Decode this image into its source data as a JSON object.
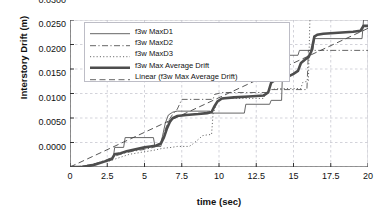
{
  "chart_data": {
    "type": "line",
    "title": "",
    "xlabel": "time (sec)",
    "ylabel": "Interstory Drift (m)",
    "xlim": [
      0,
      20
    ],
    "ylim": [
      0,
      0.03
    ],
    "xticks": [
      "0",
      "2.5",
      "5",
      "7.5",
      "10",
      "12.5",
      "15",
      "17.5",
      "20"
    ],
    "xtick_values": [
      0,
      2.5,
      5,
      7.5,
      10,
      12.5,
      15,
      17.5,
      20
    ],
    "yticks": [
      "0.0000",
      "0.0050",
      "0.0100",
      "0.0150",
      "0.0200",
      "0.0250",
      "0.0300"
    ],
    "ytick_values": [
      0,
      0.005,
      0.01,
      0.015,
      0.02,
      0.025,
      0.03
    ],
    "grid": true,
    "legend_position": "upper-left",
    "series": [
      {
        "name": "f3w  MaxD1",
        "style": "solid",
        "width": 0.9,
        "color": "#555555",
        "points": [
          [
            0,
            0.0
          ],
          [
            0.8,
            0.0
          ],
          [
            1.2,
            0.0004
          ],
          [
            1.6,
            0.0006
          ],
          [
            2.0,
            0.0008
          ],
          [
            2.4,
            0.0012
          ],
          [
            2.6,
            0.0016
          ],
          [
            2.9,
            0.0018
          ],
          [
            3.0,
            0.004
          ],
          [
            3.6,
            0.004
          ],
          [
            3.7,
            0.006
          ],
          [
            5.6,
            0.006
          ],
          [
            5.7,
            0.0042
          ],
          [
            6.1,
            0.0042
          ],
          [
            6.2,
            0.0062
          ],
          [
            6.4,
            0.009
          ],
          [
            6.6,
            0.0106
          ],
          [
            6.9,
            0.0112
          ],
          [
            7.2,
            0.0114
          ],
          [
            9.4,
            0.0114
          ],
          [
            9.5,
            0.011
          ],
          [
            11.7,
            0.011
          ],
          [
            11.8,
            0.0128
          ],
          [
            13.4,
            0.0128
          ],
          [
            13.5,
            0.0136
          ],
          [
            14.2,
            0.0136
          ],
          [
            14.3,
            0.0228
          ],
          [
            15.3,
            0.0228
          ],
          [
            15.4,
            0.0238
          ],
          [
            16.3,
            0.0238
          ],
          [
            16.4,
            0.0262
          ],
          [
            19.6,
            0.0262
          ],
          [
            19.7,
            0.03
          ],
          [
            20,
            0.03
          ]
        ]
      },
      {
        "name": "f3w  MaxD2",
        "style": "dashdot",
        "width": 0.9,
        "color": "#555555",
        "points": [
          [
            0,
            0.0
          ],
          [
            1.0,
            0.0002
          ],
          [
            1.8,
            0.0008
          ],
          [
            2.4,
            0.0014
          ],
          [
            3.0,
            0.0022
          ],
          [
            3.6,
            0.0028
          ],
          [
            4.2,
            0.0032
          ],
          [
            5.0,
            0.0036
          ],
          [
            5.6,
            0.004
          ],
          [
            6.0,
            0.0044
          ],
          [
            6.3,
            0.0068
          ],
          [
            6.6,
            0.0094
          ],
          [
            6.9,
            0.0108
          ],
          [
            7.2,
            0.0118
          ],
          [
            7.5,
            0.0138
          ],
          [
            9.6,
            0.0138
          ],
          [
            9.7,
            0.0148
          ],
          [
            10.2,
            0.0152
          ],
          [
            13.2,
            0.0152
          ],
          [
            13.3,
            0.0158
          ],
          [
            15.9,
            0.0158
          ],
          [
            16.0,
            0.0238
          ],
          [
            20,
            0.0238
          ]
        ]
      },
      {
        "name": "f3w  MaxD3",
        "style": "dotted",
        "width": 0.9,
        "color": "#555555",
        "points": [
          [
            0,
            0.0
          ],
          [
            1.0,
            0.0002
          ],
          [
            1.8,
            0.0006
          ],
          [
            2.6,
            0.0012
          ],
          [
            3.2,
            0.0018
          ],
          [
            4.0,
            0.0026
          ],
          [
            4.8,
            0.003
          ],
          [
            5.6,
            0.0034
          ],
          [
            6.2,
            0.0038
          ],
          [
            6.8,
            0.004
          ],
          [
            7.2,
            0.0042
          ],
          [
            8.0,
            0.0042
          ],
          [
            8.2,
            0.0046
          ],
          [
            8.6,
            0.0056
          ],
          [
            8.9,
            0.0064
          ],
          [
            9.3,
            0.0066
          ],
          [
            9.5,
            0.0066
          ],
          [
            9.6,
            0.0108
          ],
          [
            9.9,
            0.0136
          ],
          [
            10.4,
            0.014
          ],
          [
            13.0,
            0.014
          ],
          [
            13.1,
            0.015
          ],
          [
            13.5,
            0.0158
          ],
          [
            14.0,
            0.016
          ],
          [
            15.5,
            0.016
          ],
          [
            15.6,
            0.0172
          ],
          [
            16.0,
            0.0176
          ],
          [
            16.1,
            0.03
          ],
          [
            16.15,
            0.03
          ]
        ]
      },
      {
        "name": "f3w  Max Average Drift",
        "style": "solid",
        "width": 2.6,
        "color": "#4d4d4d",
        "points": [
          [
            0,
            0.0
          ],
          [
            0.8,
            0.0
          ],
          [
            1.2,
            0.0002
          ],
          [
            1.6,
            0.0004
          ],
          [
            2.0,
            0.0008
          ],
          [
            2.4,
            0.0012
          ],
          [
            2.8,
            0.0016
          ],
          [
            3.0,
            0.0026
          ],
          [
            3.4,
            0.0028
          ],
          [
            3.8,
            0.0032
          ],
          [
            4.4,
            0.0036
          ],
          [
            5.0,
            0.004
          ],
          [
            5.4,
            0.0042
          ],
          [
            5.8,
            0.0044
          ],
          [
            6.1,
            0.0048
          ],
          [
            6.3,
            0.006
          ],
          [
            6.5,
            0.0078
          ],
          [
            6.7,
            0.0092
          ],
          [
            6.9,
            0.01
          ],
          [
            7.2,
            0.0104
          ],
          [
            7.8,
            0.0106
          ],
          [
            8.6,
            0.0108
          ],
          [
            9.2,
            0.011
          ],
          [
            9.5,
            0.0112
          ],
          [
            9.7,
            0.0124
          ],
          [
            9.9,
            0.0134
          ],
          [
            10.2,
            0.014
          ],
          [
            11.0,
            0.0142
          ],
          [
            12.0,
            0.0144
          ],
          [
            13.0,
            0.0146
          ],
          [
            13.3,
            0.0152
          ],
          [
            13.5,
            0.0172
          ],
          [
            13.8,
            0.0178
          ],
          [
            14.2,
            0.018
          ],
          [
            14.6,
            0.0184
          ],
          [
            15.0,
            0.019
          ],
          [
            15.3,
            0.0196
          ],
          [
            15.5,
            0.0212
          ],
          [
            15.8,
            0.022
          ],
          [
            16.0,
            0.0224
          ],
          [
            16.2,
            0.0236
          ],
          [
            16.4,
            0.0266
          ],
          [
            16.6,
            0.027
          ],
          [
            17.0,
            0.0272
          ],
          [
            18.0,
            0.0274
          ],
          [
            19.0,
            0.0276
          ],
          [
            19.5,
            0.0278
          ],
          [
            19.7,
            0.0288
          ],
          [
            20,
            0.0288
          ]
        ]
      },
      {
        "name": "Linear (f3w  Max Average Drift)",
        "style": "dashed",
        "width": 0.9,
        "color": "#444444",
        "points": [
          [
            0,
            0.0
          ],
          [
            20,
            0.0283
          ]
        ]
      }
    ]
  },
  "legend": {
    "items": [
      {
        "label": "f3w  MaxD1",
        "style": "solid"
      },
      {
        "label": "f3w  MaxD2",
        "style": "dashdot"
      },
      {
        "label": "f3w  MaxD3",
        "style": "dotted"
      },
      {
        "label": "f3w  Max Average Drift",
        "style": "thick"
      },
      {
        "label": "Linear (f3w  Max Average Drift)",
        "style": "dashed"
      }
    ]
  },
  "colors": {
    "axis": "#333333",
    "grid": "#c8c8d0",
    "line": "#555555",
    "thick": "#4d4d4d",
    "background": "#ffffff"
  }
}
